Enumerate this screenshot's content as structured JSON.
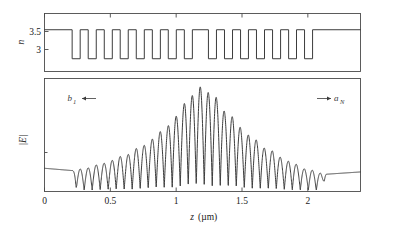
{
  "figure": {
    "caption_present": false,
    "background_color": "#ffffff",
    "line_color": "#3c3c3c",
    "frame_color": "#4a4a4a"
  },
  "axes": {
    "x": {
      "label": "z (µm)",
      "label_italic_part": "z",
      "unit_part": "(µm)",
      "ticks": [
        "0",
        "0.5",
        "1",
        "1.5",
        "2"
      ],
      "tick_values": [
        0,
        0.5,
        1,
        1.5,
        2
      ],
      "min": 0,
      "max": 2.4
    },
    "top_y": {
      "label": "n",
      "ticks": [
        "3.5",
        "3"
      ],
      "tick_values": [
        3.5,
        3
      ],
      "min": 2.78,
      "max": 3.78
    },
    "bottom_y": {
      "label": "|E|",
      "ticks": [],
      "min": 0,
      "max": 1.08
    }
  },
  "annotations": {
    "left": {
      "symbol": "b",
      "subscript": "1",
      "arrow": "left-arrow-icon",
      "arrow_glyph": "←"
    },
    "right": {
      "symbol": "a",
      "subscript": "N",
      "arrow": "right-arrow-icon",
      "arrow_glyph": "→"
    }
  },
  "chart_data": [
    {
      "type": "line",
      "name": "refractive-index-profile",
      "title": "",
      "xlabel": "z (µm)",
      "ylabel": "n",
      "xlim": [
        0,
        2.4
      ],
      "ylim": [
        2.78,
        3.78
      ],
      "grid": false,
      "legend": "none",
      "description": "Square-wave refractive index profile of a phase-shifted Bragg grating. Index alternates between n_high = 3.5 and n_low = 3. Unpatterned high-index regions at both ends, and a wider high-index region near the center corresponding to a quarter-wave phase shift.",
      "n_high": 3.5,
      "n_low": 3,
      "grating_start_z": 0.21,
      "grating_end_z": 2.14,
      "period_um": 0.1216,
      "duty_cycle": 0.5,
      "phase_shift_center_z": 1.185,
      "phase_shift_extra_um": 0.0608,
      "segments": [
        {
          "z_start": 0.0,
          "z_end": 0.21,
          "n": 3.5
        },
        {
          "z_start": 0.21,
          "z_end": 0.271,
          "n": 3.0
        },
        {
          "z_start": 0.271,
          "z_end": 0.332,
          "n": 3.5
        },
        {
          "z_start": 0.332,
          "z_end": 0.393,
          "n": 3.0
        },
        {
          "z_start": 0.393,
          "z_end": 0.454,
          "n": 3.5
        },
        {
          "z_start": 0.454,
          "z_end": 0.515,
          "n": 3.0
        },
        {
          "z_start": 0.515,
          "z_end": 0.575,
          "n": 3.5
        },
        {
          "z_start": 0.575,
          "z_end": 0.636,
          "n": 3.0
        },
        {
          "z_start": 0.636,
          "z_end": 0.697,
          "n": 3.5
        },
        {
          "z_start": 0.697,
          "z_end": 0.758,
          "n": 3.0
        },
        {
          "z_start": 0.758,
          "z_end": 0.819,
          "n": 3.5
        },
        {
          "z_start": 0.819,
          "z_end": 0.88,
          "n": 3.0
        },
        {
          "z_start": 0.88,
          "z_end": 0.94,
          "n": 3.5
        },
        {
          "z_start": 0.94,
          "z_end": 1.001,
          "n": 3.0
        },
        {
          "z_start": 1.001,
          "z_end": 1.062,
          "n": 3.5
        },
        {
          "z_start": 1.062,
          "z_end": 1.123,
          "n": 3.0
        },
        {
          "z_start": 1.123,
          "z_end": 1.245,
          "n": 3.5
        },
        {
          "z_start": 1.245,
          "z_end": 1.306,
          "n": 3.0
        },
        {
          "z_start": 1.306,
          "z_end": 1.367,
          "n": 3.5
        },
        {
          "z_start": 1.367,
          "z_end": 1.428,
          "n": 3.0
        },
        {
          "z_start": 1.428,
          "z_end": 1.489,
          "n": 3.5
        },
        {
          "z_start": 1.489,
          "z_end": 1.549,
          "n": 3.0
        },
        {
          "z_start": 1.549,
          "z_end": 1.61,
          "n": 3.5
        },
        {
          "z_start": 1.61,
          "z_end": 1.671,
          "n": 3.0
        },
        {
          "z_start": 1.671,
          "z_end": 1.732,
          "n": 3.5
        },
        {
          "z_start": 1.732,
          "z_end": 1.793,
          "n": 3.0
        },
        {
          "z_start": 1.793,
          "z_end": 1.854,
          "n": 3.5
        },
        {
          "z_start": 1.854,
          "z_end": 1.914,
          "n": 3.0
        },
        {
          "z_start": 1.914,
          "z_end": 1.975,
          "n": 3.5
        },
        {
          "z_start": 1.975,
          "z_end": 2.036,
          "n": 3.0
        },
        {
          "z_start": 2.036,
          "z_end": 2.4,
          "n": 3.5
        }
      ]
    },
    {
      "type": "line",
      "name": "field-magnitude-profile",
      "title": "",
      "xlabel": "z (µm)",
      "ylabel": "|E|",
      "xlim": [
        0,
        2.4
      ],
      "ylim": [
        0,
        1.08
      ],
      "grid": false,
      "legend": "none",
      "description": "Magnitude of the electric field |E| along the phase-shifted grating. Rectified standing-wave oscillation whose envelope peaks at the central quarter-wave phase shift and decays exponentially toward both facets, flattening to constant-amplitude travelling waves outside the grating.",
      "envelope_peak_z": 1.185,
      "envelope_peak_value": 1.0,
      "envelope_decay_per_um": 3.05,
      "baseline_left_value": 0.2,
      "baseline_right_value": 0.165,
      "oscillation_period_um": 0.1216,
      "envelope_points": [
        {
          "z": 0.0,
          "amplitude": 0.2
        },
        {
          "z": 0.21,
          "amplitude": 0.2
        },
        {
          "z": 0.3,
          "amplitude": 0.22
        },
        {
          "z": 0.45,
          "amplitude": 0.27
        },
        {
          "z": 0.6,
          "amplitude": 0.34
        },
        {
          "z": 0.75,
          "amplitude": 0.44
        },
        {
          "z": 0.9,
          "amplitude": 0.58
        },
        {
          "z": 1.0,
          "amplitude": 0.72
        },
        {
          "z": 1.1,
          "amplitude": 0.9
        },
        {
          "z": 1.185,
          "amplitude": 1.0
        },
        {
          "z": 1.28,
          "amplitude": 0.92
        },
        {
          "z": 1.4,
          "amplitude": 0.73
        },
        {
          "z": 1.55,
          "amplitude": 0.54
        },
        {
          "z": 1.7,
          "amplitude": 0.4
        },
        {
          "z": 1.85,
          "amplitude": 0.29
        },
        {
          "z": 2.0,
          "amplitude": 0.21
        },
        {
          "z": 2.14,
          "amplitude": 0.165
        },
        {
          "z": 2.4,
          "amplitude": 0.175
        }
      ]
    }
  ]
}
